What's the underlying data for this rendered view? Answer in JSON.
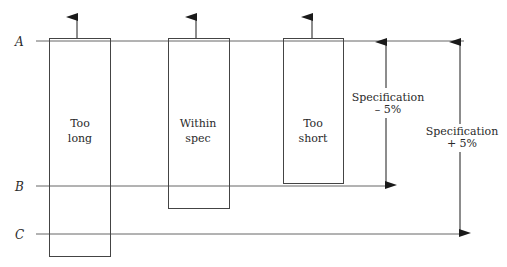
{
  "diagram": {
    "levels": [
      {
        "id": "A",
        "label": "A"
      },
      {
        "id": "B",
        "label": "B"
      },
      {
        "id": "C",
        "label": "C"
      }
    ],
    "boxes": [
      {
        "id": "too-long",
        "lines": [
          "Too",
          "long"
        ]
      },
      {
        "id": "within-spec",
        "lines": [
          "Within",
          "spec"
        ]
      },
      {
        "id": "too-short",
        "lines": [
          "Too",
          "short"
        ]
      }
    ],
    "dimensions": [
      {
        "id": "spec-minus",
        "lines": [
          "Specification",
          "– 5%"
        ],
        "from": "A",
        "to": "B"
      },
      {
        "id": "spec-plus",
        "lines": [
          "Specification",
          "+ 5%"
        ],
        "from": "A",
        "to": "C"
      }
    ],
    "colors": {
      "line": "#555555",
      "box": "#444444",
      "arrow": "#1a1a1a"
    }
  }
}
